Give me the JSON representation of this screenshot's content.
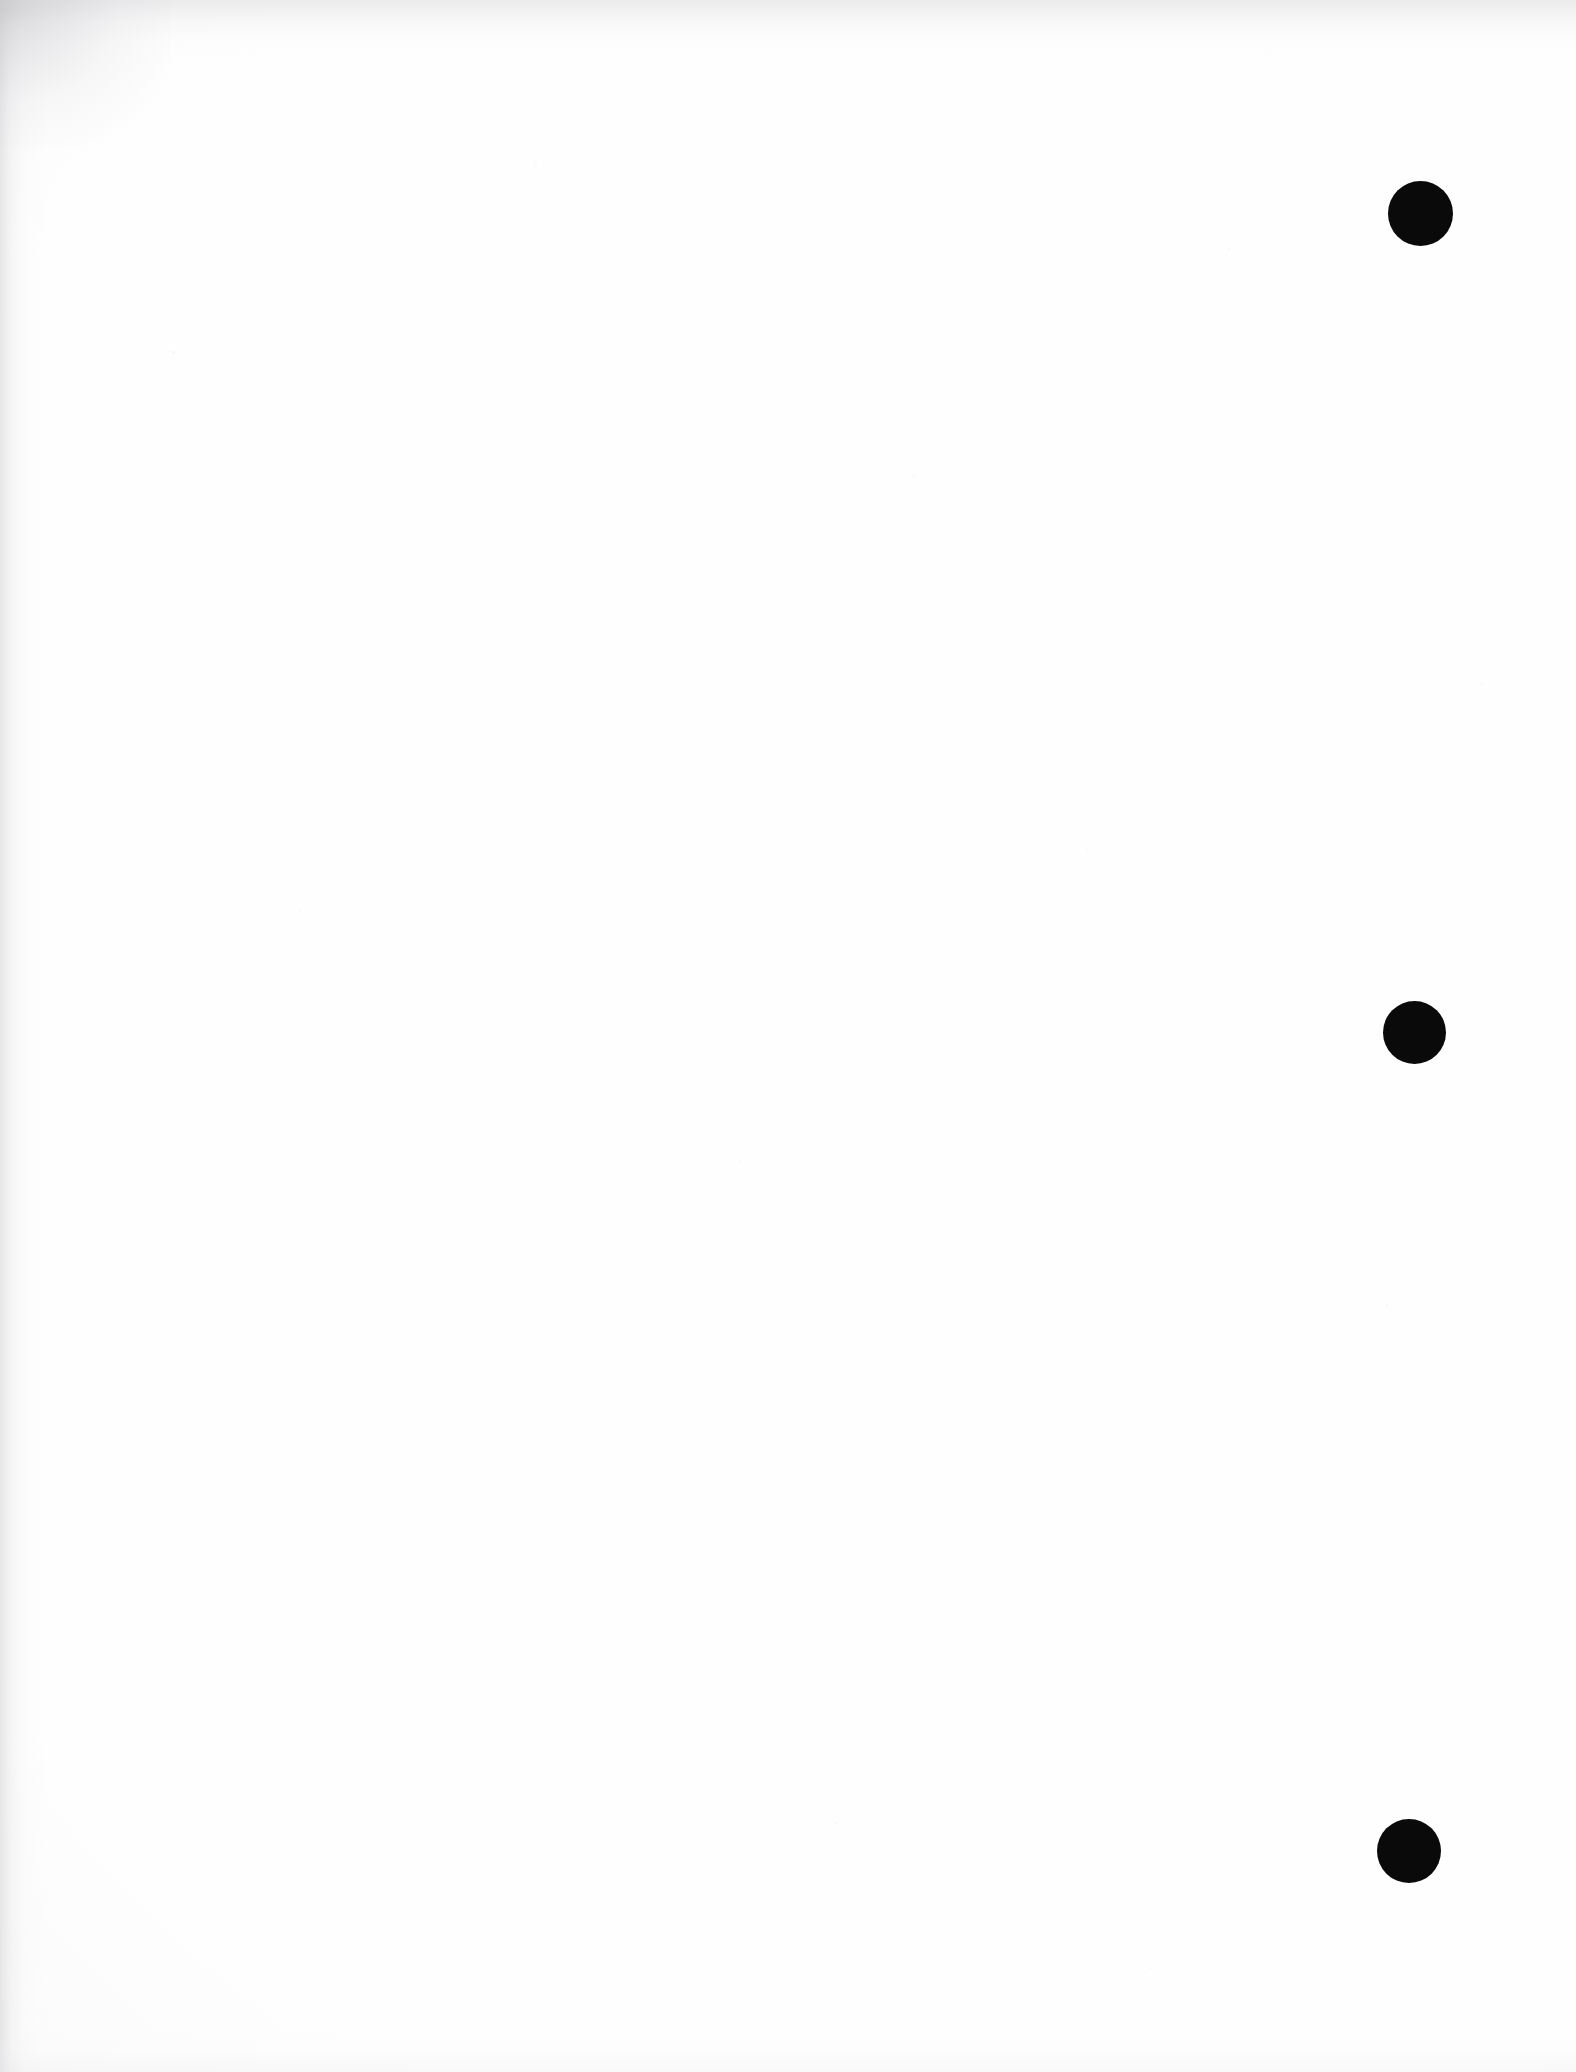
{
  "page": {
    "kind": "scanned-document-page",
    "width": 1576,
    "height": 2072,
    "background_color": "#fefefe",
    "content_text": "",
    "visible_text_count": 0,
    "note": "Blank sheet; no printed text, headings, figures or page number are visible."
  },
  "marks": {
    "color": "#0a0a0a",
    "count": 3,
    "label": "black registration dot",
    "items": [
      {
        "name": "registration-dot-top",
        "cx": 1420,
        "cy": 213,
        "diameter": 65
      },
      {
        "name": "registration-dot-middle",
        "cx": 1414,
        "cy": 1032,
        "diameter": 63
      },
      {
        "name": "registration-dot-bottom",
        "cx": 1409,
        "cy": 1851,
        "diameter": 64
      }
    ]
  },
  "scan_artifacts": {
    "left_edge_shadow": true,
    "top_edge_shadow": true,
    "bottom_edge_wash": true,
    "top_left_corner_smudge": true,
    "paper_speckle": true,
    "shadow_color": "#b0b0b4"
  }
}
